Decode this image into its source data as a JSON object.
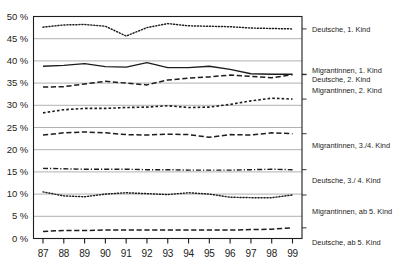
{
  "figure": {
    "title_partial": "",
    "background": "#ffffff",
    "axis_color": "#1d1d1b",
    "grid_color": "#a8a8a8"
  },
  "axes": {
    "y_label": "",
    "y_unit": "%",
    "y_ticks": [
      "50 %",
      "45 %",
      "40 %",
      "35 %",
      "30 %",
      "25 %",
      "20 %",
      "15 %",
      "10 %",
      "5 %",
      "0 %"
    ],
    "y_values": [
      50,
      45,
      40,
      35,
      30,
      25,
      20,
      15,
      10,
      5,
      0
    ],
    "x_label": "",
    "x_ticks": [
      "87",
      "88",
      "89",
      "90",
      "91",
      "92",
      "93",
      "94",
      "95",
      "96",
      "97",
      "98",
      "99"
    ]
  },
  "legend": {
    "position": "right",
    "entries": [
      {
        "label": "Deutsche, 1. Kind",
        "style": "dotted",
        "color": "#1d1d1b"
      },
      {
        "label": "Migrantinnen, 1. Kind",
        "style": "solid",
        "color": "#1d1d1b"
      },
      {
        "label": "Deutsche, 2. Kind",
        "style": "dashed",
        "color": "#1d1d1b"
      },
      {
        "label": "Migrantinnen, 2. Kind",
        "style": "dotted-md",
        "color": "#1d1d1b"
      },
      {
        "label": "Migrantinnen, 3./4. Kind",
        "style": "dashed",
        "color": "#1d1d1b"
      },
      {
        "label": "Deutsche, 3./ 4. Kind",
        "style": "dashdot",
        "color": "#1d1d1b"
      },
      {
        "label": "Migrantinnen, ab 5. Kind",
        "style": "dotted",
        "color": "#1d1d1b"
      },
      {
        "label": "Deutsche, ab 5. Kind",
        "style": "dashed",
        "color": "#1d1d1b"
      }
    ]
  },
  "chart_data": {
    "type": "line",
    "title": "",
    "xlabel": "",
    "ylabel": "",
    "x": [
      87,
      88,
      89,
      90,
      91,
      92,
      93,
      94,
      95,
      96,
      97,
      98,
      99
    ],
    "xtick_labels": [
      "87",
      "88",
      "89",
      "90",
      "91",
      "92",
      "93",
      "94",
      "95",
      "96",
      "97",
      "98",
      "99"
    ],
    "ylim": [
      0,
      50
    ],
    "ytick_values": [
      0,
      5,
      10,
      15,
      20,
      25,
      30,
      35,
      40,
      45,
      50
    ],
    "grid": "horizontal",
    "legend_position": "right",
    "series": [
      {
        "name": "Deutsche, 1. Kind",
        "style": "dotted",
        "values": [
          47.6,
          48.1,
          48.2,
          47.8,
          45.6,
          47.5,
          48.4,
          47.9,
          47.8,
          47.7,
          47.4,
          47.3,
          47.2
        ]
      },
      {
        "name": "Migrantinnen, 1. Kind",
        "style": "solid",
        "values": [
          38.8,
          39.0,
          39.4,
          38.7,
          38.6,
          39.6,
          38.5,
          38.5,
          38.8,
          38.1,
          37.1,
          37.0,
          37.0
        ]
      },
      {
        "name": "Deutsche, 2. Kind",
        "style": "dashed",
        "values": [
          34.1,
          34.2,
          34.8,
          35.4,
          35.0,
          34.6,
          35.7,
          36.1,
          36.4,
          36.8,
          36.5,
          36.2,
          36.9
        ]
      },
      {
        "name": "Migrantinnen, 2. Kind",
        "style": "dotted-md",
        "values": [
          28.3,
          29.0,
          29.3,
          29.3,
          29.5,
          29.6,
          29.9,
          29.5,
          29.6,
          30.2,
          31.0,
          31.6,
          31.4
        ]
      },
      {
        "name": "Migrantinnen, 3./4. Kind",
        "style": "dashed",
        "values": [
          23.3,
          23.8,
          24.0,
          23.8,
          23.4,
          23.3,
          23.5,
          23.4,
          22.8,
          23.4,
          23.3,
          23.8,
          23.6
        ]
      },
      {
        "name": "Deutsche, 3./ 4. Kind",
        "style": "dashdot",
        "values": [
          15.8,
          15.7,
          15.6,
          15.6,
          15.6,
          15.5,
          15.5,
          15.4,
          15.4,
          15.4,
          15.5,
          15.6,
          15.5
        ]
      },
      {
        "name": "Migrantinnen, ab 5. Kind",
        "style": "dotted",
        "values": [
          10.5,
          9.6,
          9.4,
          10.0,
          10.3,
          10.1,
          9.9,
          10.3,
          10.0,
          9.3,
          9.2,
          9.2,
          9.8
        ]
      },
      {
        "name": "Deutsche, ab 5. Kind",
        "style": "dashed",
        "values": [
          1.6,
          1.8,
          1.8,
          1.9,
          1.9,
          1.9,
          1.9,
          1.9,
          1.9,
          1.9,
          2.0,
          2.1,
          2.4
        ]
      }
    ]
  }
}
